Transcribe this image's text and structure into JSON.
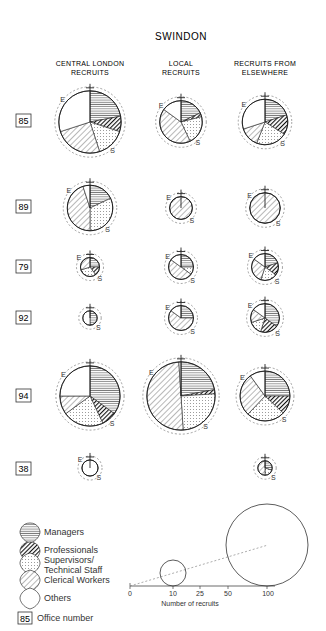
{
  "title": "SWINDON",
  "columns": [
    {
      "id": "central",
      "label_line1": "CENTRAL LONDON",
      "label_line2": "RECRUITS"
    },
    {
      "id": "local",
      "label_line1": "LOCAL",
      "label_line2": "RECRUITS"
    },
    {
      "id": "elsewhere",
      "label_line1": "RECRUITS FROM",
      "label_line2": "ELSEWHERE"
    }
  ],
  "offices": [
    {
      "number": "85"
    },
    {
      "number": "89"
    },
    {
      "number": "79"
    },
    {
      "number": "92"
    },
    {
      "number": "94"
    },
    {
      "number": "38"
    }
  ],
  "legend": {
    "items": [
      {
        "category": "managers",
        "label": "Managers",
        "pattern": "horizontal-lines"
      },
      {
        "category": "professionals",
        "label": "Professionals",
        "pattern": "heavy-diagonal"
      },
      {
        "category": "supervisors",
        "label_line1": "Supervisors/",
        "label_line2": "Technical Staff",
        "pattern": "dots"
      },
      {
        "category": "clerical",
        "label": "Clerical Workers",
        "pattern": "diagonal-lines"
      },
      {
        "category": "others",
        "label": "Others",
        "pattern": "blank"
      }
    ],
    "office_box_example": "85",
    "office_box_label": "Office number"
  },
  "scale": {
    "axis_ticks": [
      "0",
      "10",
      "25",
      "50",
      "100"
    ],
    "axis_label": "Number of recruits",
    "reference_circles": [
      10,
      100
    ]
  },
  "markers": {
    "east": "E",
    "south": "S"
  },
  "colors": {
    "ink": "#222222",
    "paper": "#ffffff",
    "dashed": "#666666"
  },
  "chart_data": {
    "type": "pie",
    "title": "SWINDON",
    "categories": [
      "Managers",
      "Professionals",
      "Supervisors/Technical Staff",
      "Clerical Workers",
      "Others"
    ],
    "columns": [
      "Central London Recruits",
      "Local Recruits",
      "Recruits from Elsewhere"
    ],
    "offices": [
      {
        "office": "85",
        "approx_recruits": {
          "central": 75,
          "local": 35,
          "elsewhere": 40
        },
        "shares_pct": {
          "central": [
            22,
            8,
            15,
            25,
            30
          ],
          "local": [
            18,
            3,
            22,
            42,
            15
          ],
          "elsewhere": [
            20,
            14,
            22,
            14,
            30
          ]
        }
      },
      {
        "office": "89",
        "approx_recruits": {
          "central": 40,
          "local": 10,
          "elsewhere": 18
        },
        "shares_pct": {
          "central": [
            18,
            0,
            32,
            45,
            5
          ],
          "local": [
            0,
            0,
            0,
            100,
            0
          ],
          "elsewhere": [
            0,
            0,
            0,
            100,
            0
          ]
        }
      },
      {
        "office": "79",
        "approx_recruits": {
          "central": 7,
          "local": 12,
          "elsewhere": 14
        },
        "shares_pct": {
          "central": [
            25,
            15,
            30,
            30,
            0
          ],
          "local": [
            25,
            0,
            10,
            50,
            15
          ],
          "elsewhere": [
            20,
            15,
            20,
            30,
            15
          ]
        }
      },
      {
        "office": "92",
        "approx_recruits": {
          "central": 4,
          "local": 12,
          "elsewhere": 16
        },
        "shares_pct": {
          "central": [
            50,
            0,
            0,
            0,
            50
          ],
          "local": [
            25,
            0,
            0,
            60,
            15
          ],
          "elsewhere": [
            35,
            20,
            15,
            15,
            15
          ]
        }
      },
      {
        "office": "94",
        "approx_recruits": {
          "central": 70,
          "local": 90,
          "elsewhere": 48
        },
        "shares_pct": {
          "central": [
            35,
            8,
            22,
            10,
            25
          ],
          "local": [
            22,
            2,
            25,
            50,
            1
          ],
          "elsewhere": [
            25,
            12,
            25,
            28,
            10
          ]
        }
      },
      {
        "office": "38",
        "approx_recruits": {
          "central": 5,
          "local": 0,
          "elsewhere": 4
        },
        "shares_pct": {
          "central": [
            0,
            0,
            0,
            0,
            100
          ],
          "local": [],
          "elsewhere": [
            30,
            0,
            20,
            50,
            0
          ]
        }
      }
    ],
    "legend_position": "bottom-left",
    "size_scale": {
      "axis": [
        0,
        10,
        25,
        50,
        100
      ],
      "xlabel": "Number of recruits"
    }
  }
}
